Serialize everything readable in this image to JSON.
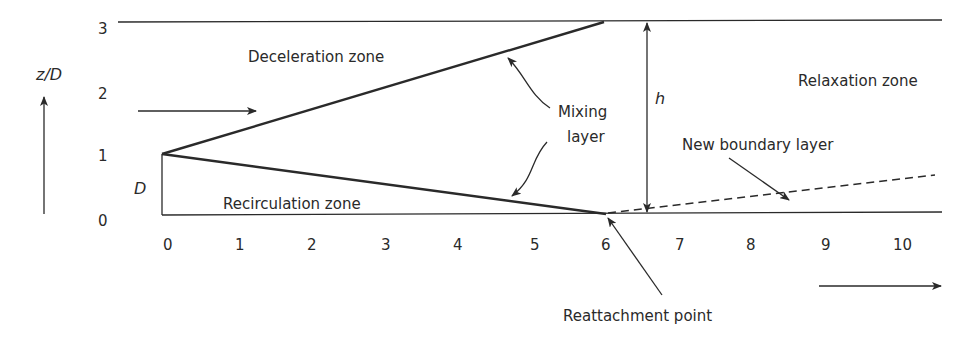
{
  "diagram": {
    "type": "flow-over-backward-facing-step",
    "y_axis": {
      "label": "z/D",
      "ticks": [
        "0",
        "1",
        "2",
        "3"
      ]
    },
    "x_axis": {
      "ticks": [
        "0",
        "1",
        "2",
        "3",
        "4",
        "5",
        "6",
        "7",
        "8",
        "9",
        "10"
      ]
    },
    "labels": {
      "deceleration_zone": "Deceleration zone",
      "recirculation_zone": "Recirculation zone",
      "relaxation_zone": "Relaxation zone",
      "mixing_layer_line1": "Mixing",
      "mixing_layer_line2": "layer",
      "new_boundary_layer": "New boundary layer",
      "reattachment_point": "Reattachment point",
      "step_height": "D",
      "channel_height": "h"
    },
    "colors": {
      "ink": "#2a2a2a",
      "background": "#ffffff"
    }
  }
}
